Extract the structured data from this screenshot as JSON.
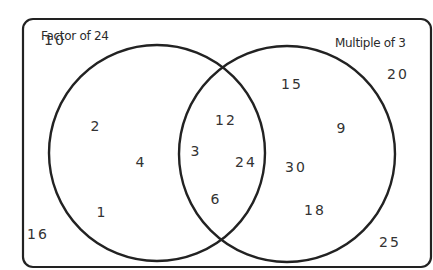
{
  "diagram": {
    "type": "venn",
    "sets": [
      {
        "id": "A",
        "label": "Factor of 24"
      },
      {
        "id": "B",
        "label": "Multiple of 3"
      }
    ],
    "regions": {
      "only_A": [
        "2",
        "4",
        "1"
      ],
      "A_and_B": [
        "12",
        "3",
        "24",
        "6"
      ],
      "only_B": [
        "15",
        "9",
        "30",
        "18"
      ],
      "outside": [
        "10",
        "16",
        "20",
        "25"
      ]
    },
    "colors": {
      "stroke": "#222222",
      "text": "#333333",
      "background": "#ffffff"
    }
  },
  "labels": {
    "left_set": "Factor of 24",
    "right_set": "Multiple of 3"
  },
  "numbers": [
    {
      "value": "10",
      "x": 55,
      "y": 40
    },
    {
      "value": "2",
      "x": 96,
      "y": 126
    },
    {
      "value": "4",
      "x": 141,
      "y": 162
    },
    {
      "value": "1",
      "x": 102,
      "y": 212
    },
    {
      "value": "16",
      "x": 38,
      "y": 234
    },
    {
      "value": "12",
      "x": 226,
      "y": 120
    },
    {
      "value": "3",
      "x": 196,
      "y": 151
    },
    {
      "value": "24",
      "x": 246,
      "y": 162
    },
    {
      "value": "6",
      "x": 216,
      "y": 199
    },
    {
      "value": "15",
      "x": 292,
      "y": 84
    },
    {
      "value": "9",
      "x": 342,
      "y": 128
    },
    {
      "value": "30",
      "x": 296,
      "y": 167
    },
    {
      "value": "18",
      "x": 315,
      "y": 210
    },
    {
      "value": "20",
      "x": 398,
      "y": 74
    },
    {
      "value": "25",
      "x": 390,
      "y": 242
    }
  ]
}
